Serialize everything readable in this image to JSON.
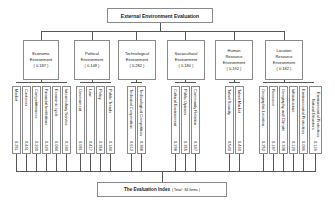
{
  "title": "External Environment Evaluation",
  "footer": {
    "label": "The Evaluation Index",
    "total": "( Total : 84 Items )"
  },
  "categories": [
    {
      "name_line1": "Economic",
      "name_line2": "Environment",
      "name_line3": "",
      "weight": "( 0.187 )",
      "leaves": [
        {
          "label": "Market",
          "value": "0.251"
        },
        {
          "label": "Customer",
          "value": "0.441"
        },
        {
          "label": "Competitiveness",
          "value": "0.200"
        },
        {
          "label": "Financial Institutions",
          "value": "0.329"
        },
        {
          "label": "Economic cycle",
          "value": "0.084"
        },
        {
          "label": "Intermediary Service",
          "value": "0.180"
        }
      ]
    },
    {
      "name_line1": "Political",
      "name_line2": "Environment",
      "name_line3": "",
      "weight": "( 0.148 )",
      "leaves": [
        {
          "label": "Government",
          "value": "0.081"
        },
        {
          "label": "Law",
          "value": "0.417"
        },
        {
          "label": "Policy",
          "value": "0.358"
        },
        {
          "label": "Public Trends",
          "value": "0.144"
        }
      ]
    },
    {
      "name_line1": "Technological",
      "name_line2": "Environment",
      "name_line3": "",
      "weight": "( 0.282 )",
      "leaves": [
        {
          "label": "Technical Cooperation",
          "value": "0.612"
        },
        {
          "label": "Technological Competition",
          "value": "0.388"
        }
      ]
    },
    {
      "name_line1": "Sociocultural",
      "name_line2": "Environment",
      "name_line3": "",
      "weight": "( 0.180 )",
      "leaves": [
        {
          "label": "Cultural Environment",
          "value": "0.298"
        },
        {
          "label": "Public Opinion",
          "value": "0.355"
        },
        {
          "label": "Community Relation",
          "value": "0.347"
        }
      ]
    },
    {
      "name_line1": "Human",
      "name_line2": "Resource",
      "name_line3": "Environment",
      "weight": "( 0.192 )",
      "leaves": [
        {
          "label": "Talent Scarcity",
          "value": "0.540"
        },
        {
          "label": "Talent Market",
          "value": "0.460"
        }
      ]
    },
    {
      "name_line1": "Location",
      "name_line2": "Resource",
      "name_line3": "Environment",
      "weight": "( 0.182 )",
      "leaves": [
        {
          "label": "Geographic Location",
          "value": "0.252"
        },
        {
          "label": "Resource",
          "value": "0.187"
        },
        {
          "label": "Geography and Climate",
          "value": "0.308"
        },
        {
          "label": "Infrastructure",
          "value": "0.129"
        },
        {
          "label": "Environmental Protection",
          "value": "0.086"
        },
        {
          "label": "Environmental Protection Natural Disasters",
          "value": "0.118"
        }
      ]
    }
  ]
}
